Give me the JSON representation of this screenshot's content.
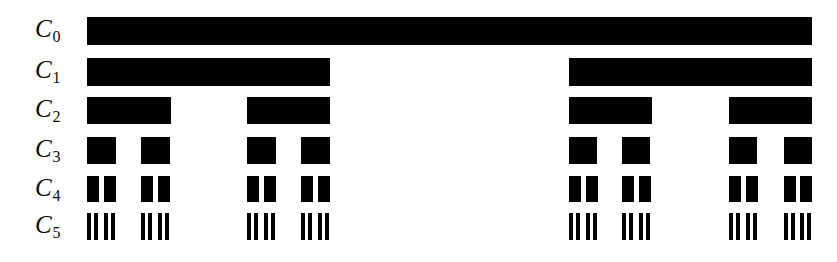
{
  "figure": {
    "background_color": "#ffffff",
    "bar_color": "#000000",
    "label_color": "#0d0d0d",
    "width": 837,
    "height": 262
  },
  "chart_data": {
    "type": "bar",
    "title": "",
    "subtitle": "",
    "xlabel": "",
    "ylabel": "",
    "orientation": "horizontal",
    "grid": false,
    "legend": null,
    "axis_visible": false,
    "xlim": [
      87,
      812
    ],
    "categories": [
      "C0",
      "C1",
      "C2",
      "C3",
      "C4",
      "C5"
    ],
    "level_count": 6,
    "levels": [
      {
        "name": "C0",
        "label_c": "C",
        "label_sub": "0",
        "label_x": 35,
        "label_y": 16,
        "bar_top": 17,
        "bar_height": 28,
        "segment_count": 1,
        "segments": [
          {
            "x": 87,
            "width": 725
          }
        ]
      },
      {
        "name": "C1",
        "label_c": "C",
        "label_sub": "1",
        "label_x": 35,
        "label_y": 57,
        "bar_top": 58,
        "bar_height": 28,
        "segment_count": 2,
        "segments": [
          {
            "x": 87,
            "width": 243
          },
          {
            "x": 569,
            "width": 243
          }
        ]
      },
      {
        "name": "C2",
        "label_c": "C",
        "label_sub": "2",
        "label_x": 35,
        "label_y": 96,
        "bar_top": 97,
        "bar_height": 27,
        "segment_count": 4,
        "segments": [
          {
            "x": 87,
            "width": 84
          },
          {
            "x": 247,
            "width": 83
          },
          {
            "x": 569,
            "width": 83
          },
          {
            "x": 729,
            "width": 83
          }
        ]
      },
      {
        "name": "C3",
        "label_c": "C",
        "label_sub": "3",
        "label_x": 35,
        "label_y": 136,
        "bar_top": 137,
        "bar_height": 27,
        "segment_count": 8,
        "segments": [
          {
            "x": 87,
            "width": 29
          },
          {
            "x": 141,
            "width": 29
          },
          {
            "x": 247,
            "width": 29
          },
          {
            "x": 301,
            "width": 29
          },
          {
            "x": 569,
            "width": 28
          },
          {
            "x": 622,
            "width": 28
          },
          {
            "x": 729,
            "width": 28
          },
          {
            "x": 784,
            "width": 28
          }
        ]
      },
      {
        "name": "C4",
        "label_c": "C",
        "label_sub": "4",
        "label_x": 35,
        "label_y": 175,
        "bar_top": 176,
        "bar_height": 26,
        "segment_count": 16,
        "segments": [
          {
            "x": 87,
            "width": 12
          },
          {
            "x": 104,
            "width": 12
          },
          {
            "x": 141,
            "width": 12
          },
          {
            "x": 158,
            "width": 12
          },
          {
            "x": 247,
            "width": 12
          },
          {
            "x": 264,
            "width": 12
          },
          {
            "x": 301,
            "width": 12
          },
          {
            "x": 318,
            "width": 12
          },
          {
            "x": 569,
            "width": 12
          },
          {
            "x": 586,
            "width": 12
          },
          {
            "x": 622,
            "width": 12
          },
          {
            "x": 639,
            "width": 12
          },
          {
            "x": 729,
            "width": 12
          },
          {
            "x": 746,
            "width": 12
          },
          {
            "x": 784,
            "width": 12
          },
          {
            "x": 800,
            "width": 12
          }
        ]
      },
      {
        "name": "C5",
        "label_c": "C",
        "label_sub": "5",
        "label_x": 35,
        "label_y": 212,
        "bar_top": 213,
        "bar_height": 27,
        "segment_count": 32,
        "segments": [
          {
            "x": 87,
            "width": 4
          },
          {
            "x": 94,
            "width": 4
          },
          {
            "x": 104,
            "width": 4
          },
          {
            "x": 111,
            "width": 4
          },
          {
            "x": 141,
            "width": 4
          },
          {
            "x": 148,
            "width": 4
          },
          {
            "x": 158,
            "width": 4
          },
          {
            "x": 165,
            "width": 4
          },
          {
            "x": 247,
            "width": 4
          },
          {
            "x": 254,
            "width": 4
          },
          {
            "x": 264,
            "width": 4
          },
          {
            "x": 271,
            "width": 4
          },
          {
            "x": 301,
            "width": 4
          },
          {
            "x": 308,
            "width": 4
          },
          {
            "x": 318,
            "width": 4
          },
          {
            "x": 325,
            "width": 4
          },
          {
            "x": 569,
            "width": 4
          },
          {
            "x": 576,
            "width": 4
          },
          {
            "x": 586,
            "width": 4
          },
          {
            "x": 593,
            "width": 4
          },
          {
            "x": 622,
            "width": 4
          },
          {
            "x": 629,
            "width": 4
          },
          {
            "x": 639,
            "width": 4
          },
          {
            "x": 646,
            "width": 4
          },
          {
            "x": 729,
            "width": 4
          },
          {
            "x": 736,
            "width": 4
          },
          {
            "x": 746,
            "width": 4
          },
          {
            "x": 753,
            "width": 4
          },
          {
            "x": 784,
            "width": 4
          },
          {
            "x": 791,
            "width": 4
          },
          {
            "x": 800,
            "width": 4
          },
          {
            "x": 807,
            "width": 4
          }
        ]
      }
    ]
  }
}
